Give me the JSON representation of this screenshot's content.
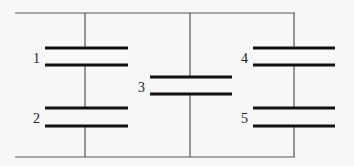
{
  "diagram": {
    "type": "capacitor-circuit",
    "capacitors": [
      {
        "label": "1"
      },
      {
        "label": "2"
      },
      {
        "label": "3"
      },
      {
        "label": "4"
      },
      {
        "label": "5"
      }
    ],
    "colors": {
      "wire": "#555555",
      "plate": "#111111",
      "background": "#f7f7f7"
    }
  }
}
